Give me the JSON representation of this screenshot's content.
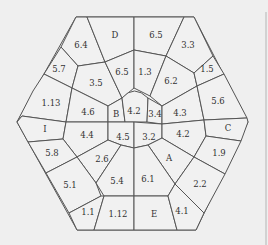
{
  "diagram": {
    "shape": "hexagon",
    "background": "#efefef",
    "stroke_color": "#555555",
    "cells": [
      {
        "id": "c-6-4",
        "label": "6.4"
      },
      {
        "id": "c-D",
        "label": "D"
      },
      {
        "id": "c-6-5-top",
        "label": "6.5"
      },
      {
        "id": "c-3-3",
        "label": "3.3"
      },
      {
        "id": "c-5-7",
        "label": "5.7"
      },
      {
        "id": "c-3-5",
        "label": "3.5"
      },
      {
        "id": "c-6-5-inner",
        "label": "6.5"
      },
      {
        "id": "c-1-3",
        "label": "1.3"
      },
      {
        "id": "c-6-2",
        "label": "6.2"
      },
      {
        "id": "c-1-5",
        "label": "1.5"
      },
      {
        "id": "c-1-13",
        "label": "1.13"
      },
      {
        "id": "c-4-6",
        "label": "4.6"
      },
      {
        "id": "c-B",
        "label": "B"
      },
      {
        "id": "c-4-2-center",
        "label": "4.2"
      },
      {
        "id": "c-3-4",
        "label": "3.4"
      },
      {
        "id": "c-4-3",
        "label": "4.3"
      },
      {
        "id": "c-5-6",
        "label": "5.6"
      },
      {
        "id": "c-I",
        "label": "I"
      },
      {
        "id": "c-4-4",
        "label": "4.4"
      },
      {
        "id": "c-4-5",
        "label": "4.5"
      },
      {
        "id": "c-3-2",
        "label": "3.2"
      },
      {
        "id": "c-4-2-right",
        "label": "4.2"
      },
      {
        "id": "c-C",
        "label": "C"
      },
      {
        "id": "c-5-8",
        "label": "5.8"
      },
      {
        "id": "c-2-6",
        "label": "2.6"
      },
      {
        "id": "c-A",
        "label": "A"
      },
      {
        "id": "c-1-9",
        "label": "1.9"
      },
      {
        "id": "c-5-1",
        "label": "5.1"
      },
      {
        "id": "c-5-4",
        "label": "5.4"
      },
      {
        "id": "c-6-1",
        "label": "6.1"
      },
      {
        "id": "c-2-2",
        "label": "2.2"
      },
      {
        "id": "c-1-1",
        "label": "1.1"
      },
      {
        "id": "c-1-12",
        "label": "1.12"
      },
      {
        "id": "c-E",
        "label": "E"
      },
      {
        "id": "c-4-1",
        "label": "4.1"
      }
    ]
  }
}
